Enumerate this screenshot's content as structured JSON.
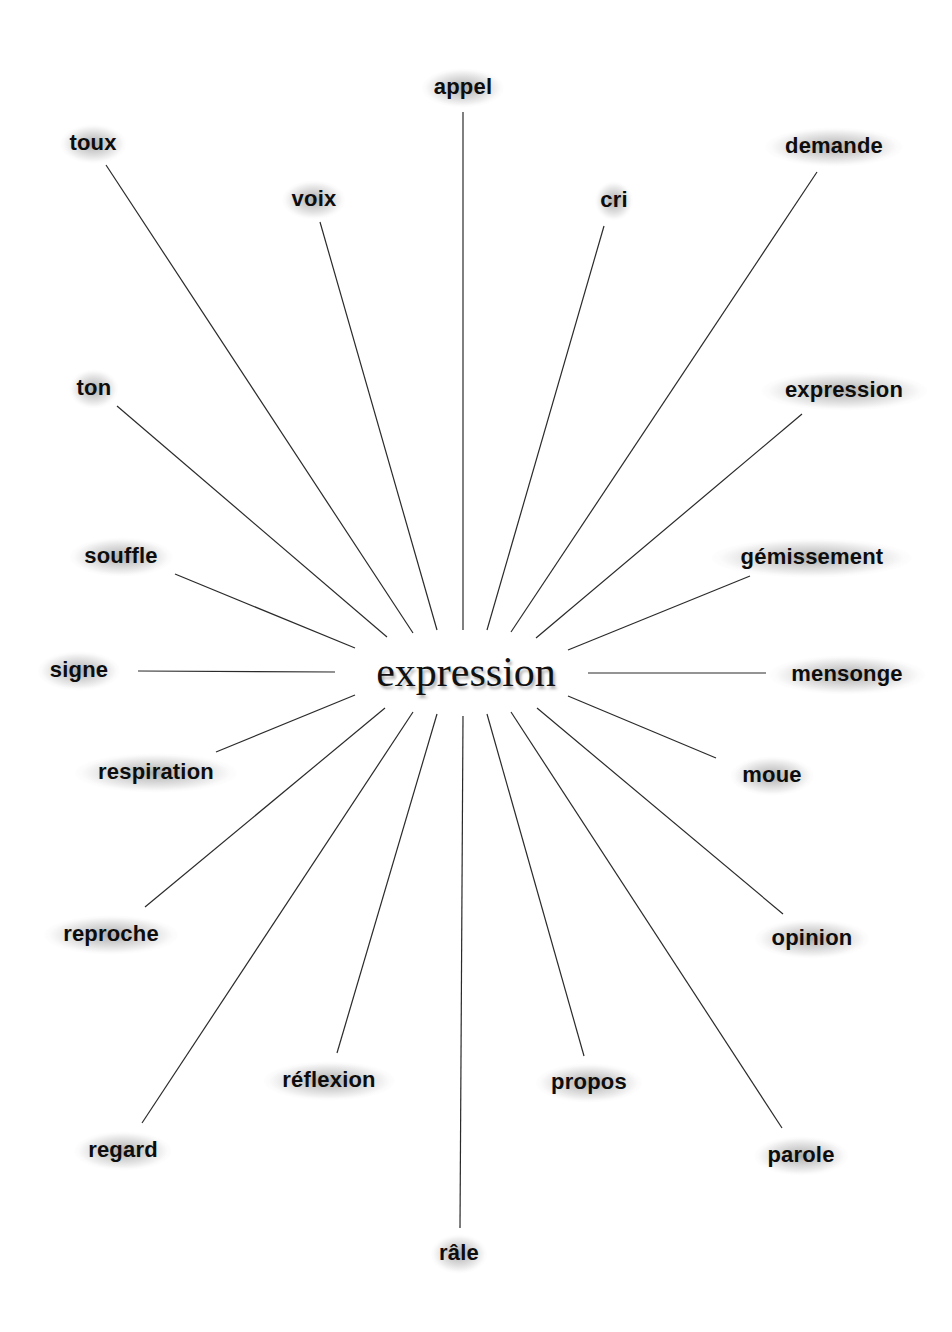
{
  "diagram": {
    "center": {
      "label": "expression",
      "x": 466,
      "y": 672
    },
    "nodes": [
      {
        "id": "appel",
        "label": "appel",
        "x": 463,
        "y": 87,
        "line": [
          463,
          112,
          463,
          630
        ]
      },
      {
        "id": "toux",
        "label": "toux",
        "x": 93,
        "y": 143,
        "line": [
          106,
          165,
          413,
          633
        ]
      },
      {
        "id": "voix",
        "label": "voix",
        "x": 314,
        "y": 199,
        "line": [
          320,
          222,
          437,
          630
        ]
      },
      {
        "id": "cri",
        "label": "cri",
        "x": 614,
        "y": 200,
        "line": [
          604,
          226,
          487,
          630
        ]
      },
      {
        "id": "demande",
        "label": "demande",
        "x": 834,
        "y": 146,
        "line": [
          817,
          172,
          511,
          632
        ]
      },
      {
        "id": "ton",
        "label": "ton",
        "x": 94,
        "y": 388,
        "line": [
          117,
          406,
          387,
          637
        ]
      },
      {
        "id": "expression-right",
        "label": "expression",
        "x": 844,
        "y": 390,
        "line": [
          802,
          414,
          536,
          638
        ]
      },
      {
        "id": "souffle",
        "label": "souffle",
        "x": 121,
        "y": 556,
        "line": [
          175,
          574,
          355,
          648
        ]
      },
      {
        "id": "gemissement",
        "label": "gémissement",
        "x": 812,
        "y": 557,
        "line": [
          750,
          576,
          568,
          650
        ]
      },
      {
        "id": "signe",
        "label": "signe",
        "x": 79,
        "y": 670,
        "line": [
          138,
          671,
          335,
          672
        ]
      },
      {
        "id": "mensonge",
        "label": "mensonge",
        "x": 847,
        "y": 674,
        "line": [
          588,
          673,
          766,
          673
        ]
      },
      {
        "id": "respiration",
        "label": "respiration",
        "x": 156,
        "y": 772,
        "line": [
          216,
          752,
          355,
          695
        ]
      },
      {
        "id": "moue",
        "label": "moue",
        "x": 772,
        "y": 775,
        "line": [
          716,
          758,
          568,
          696
        ]
      },
      {
        "id": "reproche",
        "label": "reproche",
        "x": 111,
        "y": 934,
        "line": [
          145,
          907,
          385,
          708
        ]
      },
      {
        "id": "opinion",
        "label": "opinion",
        "x": 812,
        "y": 938,
        "line": [
          783,
          914,
          537,
          708
        ]
      },
      {
        "id": "reflexion",
        "label": "réflexion",
        "x": 329,
        "y": 1080,
        "line": [
          337,
          1053,
          437,
          714
        ]
      },
      {
        "id": "propos",
        "label": "propos",
        "x": 589,
        "y": 1082,
        "line": [
          584,
          1056,
          487,
          714
        ]
      },
      {
        "id": "regard",
        "label": "regard",
        "x": 123,
        "y": 1150,
        "line": [
          142,
          1123,
          413,
          712
        ]
      },
      {
        "id": "parole",
        "label": "parole",
        "x": 801,
        "y": 1155,
        "line": [
          782,
          1128,
          511,
          712
        ]
      },
      {
        "id": "rale",
        "label": "râle",
        "x": 459,
        "y": 1253,
        "line": [
          460,
          1228,
          463,
          716
        ]
      }
    ]
  }
}
